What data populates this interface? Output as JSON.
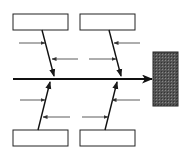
{
  "diagram": {
    "type": "fishbone",
    "colors": {
      "line": "#1a1a1a",
      "box_fill": "#ffffff",
      "head_fill": "#4a4a4a",
      "background": "#ffffff"
    },
    "categories": [
      {
        "position": "top-left",
        "label": ""
      },
      {
        "position": "top-right",
        "label": ""
      },
      {
        "position": "bottom-left",
        "label": ""
      },
      {
        "position": "bottom-right",
        "label": ""
      }
    ],
    "effect": {
      "label": ""
    },
    "sub_cause_arrows_per_branch": 2
  }
}
